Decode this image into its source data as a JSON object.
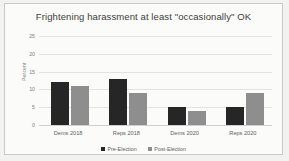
{
  "chart_data": {
    "type": "bar",
    "title": "Frightening harassment at least \"occasionally\" OK",
    "xlabel": "",
    "ylabel": "Percent",
    "categories": [
      "Dems 2018",
      "Reps 2018",
      "Dems 2020",
      "Reps 2020"
    ],
    "series": [
      {
        "name": "Pre-Election",
        "values": [
          12,
          13,
          5,
          5
        ],
        "color": "#262626"
      },
      {
        "name": "Post-Election",
        "values": [
          11,
          9,
          4,
          9
        ],
        "color": "#8e8e8e"
      }
    ],
    "ylim": [
      0,
      25
    ],
    "yticks": [
      0,
      5,
      10,
      15,
      20,
      25
    ],
    "ytick_labels": [
      "0",
      "5",
      "10",
      "15",
      "20",
      "25"
    ],
    "grid": true,
    "legend_position": "bottom"
  },
  "legend": {
    "items": [
      {
        "label": "Pre-Election"
      },
      {
        "label": "Post-Election"
      }
    ]
  },
  "colors": {
    "pre_election": "#262626",
    "post_election": "#8e8e8e",
    "grid": "#e2e2e0",
    "frame": "#c9c9c7",
    "plot_background": "#fbfbfa",
    "page_background": "#f2f2f0",
    "title_text": "#3b3b3b",
    "tick_text": "#7b7b7b"
  }
}
